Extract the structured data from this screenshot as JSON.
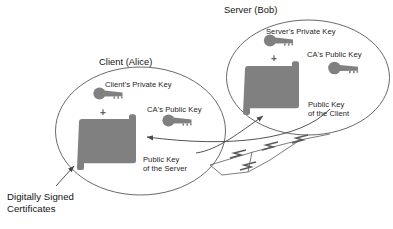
{
  "diagram": {
    "colors": {
      "shape_fill": "#808080",
      "outline": "#4d4d4d",
      "text": "#1a1a1a",
      "background": "#ffffff"
    },
    "groups": [
      {
        "id": "client",
        "title": "Client (Alice)",
        "private_key_label": "Client's Private Key",
        "plus_symbol": "+",
        "ca_key_label": "CA's Public Key",
        "certificate_label": "Public Key\nof the Server",
        "certificate_label_line1": "Public Key",
        "certificate_label_line2": "of the Server"
      },
      {
        "id": "server",
        "title": "Server (Bob)",
        "private_key_label": "Server's Private Key",
        "plus_symbol": "+",
        "ca_key_label": "CA's Public Key",
        "certificate_label": "Public Key\nof the Client",
        "certificate_label_line1": "Public Key",
        "certificate_label_line2": "of the Client"
      }
    ],
    "annotation": {
      "line1": "Digitally Signed",
      "line2": "Certificates"
    },
    "icons": {
      "private_key": "key-icon",
      "public_key": "key-icon",
      "certificate": "certificate-icon",
      "network_link": "lightning-link-icon",
      "exchange_arrow": "arrow-icon",
      "callout_arrow": "arrow-icon"
    }
  }
}
